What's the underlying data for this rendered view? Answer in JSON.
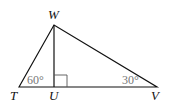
{
  "diagram": {
    "type": "right-triangle-with-altitude",
    "vertices": {
      "W": {
        "label": "W",
        "x": 54,
        "y": 25
      },
      "T": {
        "label": "T",
        "x": 19,
        "y": 87
      },
      "U": {
        "label": "U",
        "x": 54,
        "y": 87
      },
      "V": {
        "label": "V",
        "x": 157,
        "y": 87
      }
    },
    "angles": {
      "T": {
        "label": "60°"
      },
      "V": {
        "label": "30°"
      },
      "U": {
        "label": "right-angle"
      }
    },
    "colors": {
      "line": "#111111",
      "angle_text": "#777777",
      "vertex_text": "#111111"
    }
  }
}
